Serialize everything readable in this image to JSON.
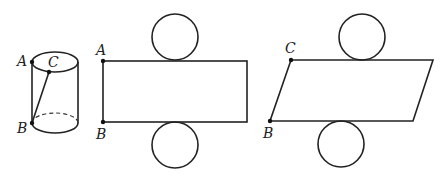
{
  "figure": {
    "cylinder": {
      "labels": {
        "A": "A",
        "B": "B",
        "C": "C"
      }
    },
    "net_rectangle": {
      "labels": {
        "A": "A",
        "B": "B"
      }
    },
    "net_parallelogram": {
      "labels": {
        "C": "C",
        "B": "B"
      }
    }
  }
}
